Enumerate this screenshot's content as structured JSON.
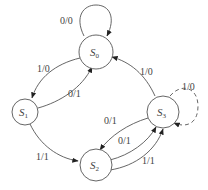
{
  "diagram": {
    "type": "state-machine",
    "states": [
      {
        "id": "S0",
        "name": "S",
        "sub": "0"
      },
      {
        "id": "S1",
        "name": "S",
        "sub": "1"
      },
      {
        "id": "S2",
        "name": "S",
        "sub": "2"
      },
      {
        "id": "S3",
        "name": "S",
        "sub": "3"
      }
    ],
    "transitions": [
      {
        "from": "S0",
        "to": "S0",
        "label": "0/0"
      },
      {
        "from": "S0",
        "to": "S1",
        "label": "1/0"
      },
      {
        "from": "S1",
        "to": "S0",
        "label": "0/1"
      },
      {
        "from": "S1",
        "to": "S2",
        "label": "1/1"
      },
      {
        "from": "S3",
        "to": "S0",
        "label": "1/0"
      },
      {
        "from": "S3",
        "to": "S3",
        "label": "1/0",
        "style": "dashed"
      },
      {
        "from": "S3",
        "to": "S2",
        "label": "0/1"
      },
      {
        "from": "S2",
        "to": "S3",
        "label": "0/1"
      },
      {
        "from": "S2",
        "to": "S3",
        "label": "1/1"
      }
    ]
  }
}
